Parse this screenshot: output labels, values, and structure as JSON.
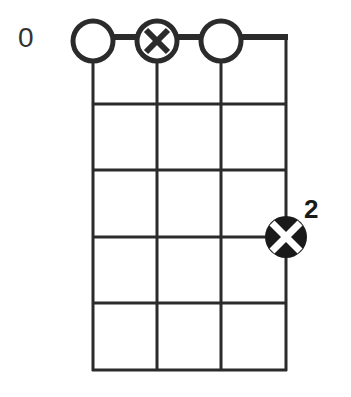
{
  "diagram": {
    "type": "chord-diagram",
    "strings": 4,
    "frets_shown": 5,
    "start_fret_label": "0",
    "open_markers": [
      {
        "string": 1,
        "type": "open"
      },
      {
        "string": 2,
        "type": "muted"
      },
      {
        "string": 3,
        "type": "open"
      }
    ],
    "finger_markers": [
      {
        "string": 4,
        "fret_line": 3,
        "type": "muted-fretted",
        "finger": "2"
      }
    ],
    "colors": {
      "line": "#2b2b2b",
      "marker_fill": "#1a1a1a",
      "background": "#ffffff"
    }
  }
}
